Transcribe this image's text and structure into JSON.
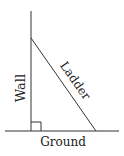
{
  "diagram": {
    "type": "right-triangle-ladder",
    "labels": {
      "wall": "Wall",
      "ladder": "Ladder",
      "ground": "Ground"
    },
    "colors": {
      "line": "#333333",
      "text": "#222222",
      "background": "#ffffff"
    },
    "right_angle_marker": true
  }
}
